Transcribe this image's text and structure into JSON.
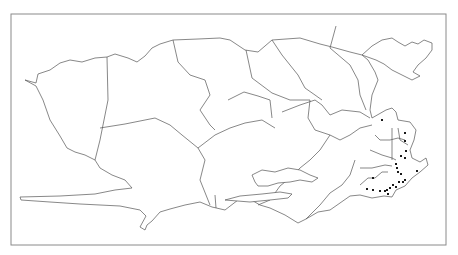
{
  "map": {
    "type": "administrative-region outline map",
    "frame": {
      "x": 11,
      "y": 14,
      "width": 435,
      "height": 231,
      "stroke": "#8a8a8a"
    },
    "outline_color": "#555555",
    "point_color": "#1a1a1a",
    "points": [
      {
        "x": 382,
        "y": 120
      },
      {
        "x": 405,
        "y": 133
      },
      {
        "x": 405,
        "y": 141
      },
      {
        "x": 406,
        "y": 151
      },
      {
        "x": 401,
        "y": 156
      },
      {
        "x": 405,
        "y": 158
      },
      {
        "x": 396,
        "y": 164
      },
      {
        "x": 397,
        "y": 168
      },
      {
        "x": 398,
        "y": 172
      },
      {
        "x": 401,
        "y": 174
      },
      {
        "x": 417,
        "y": 171
      },
      {
        "x": 373,
        "y": 178
      },
      {
        "x": 405,
        "y": 180
      },
      {
        "x": 399,
        "y": 182
      },
      {
        "x": 403,
        "y": 182
      },
      {
        "x": 393,
        "y": 185
      },
      {
        "x": 396,
        "y": 187
      },
      {
        "x": 390,
        "y": 188
      },
      {
        "x": 387,
        "y": 190
      },
      {
        "x": 367,
        "y": 189
      },
      {
        "x": 373,
        "y": 190
      },
      {
        "x": 380,
        "y": 191
      },
      {
        "x": 385,
        "y": 191
      },
      {
        "x": 388,
        "y": 194
      }
    ]
  }
}
